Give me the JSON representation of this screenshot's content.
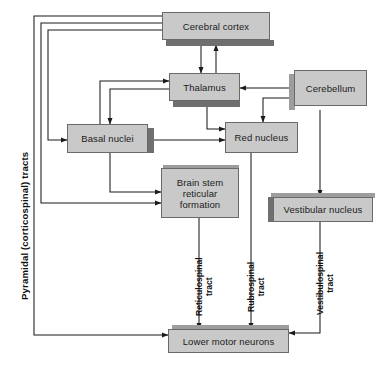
{
  "diagram": {
    "side_label": "Pyramidal (corticospinal) tracts",
    "colors": {
      "box_fill": "#c9c9c9",
      "box_border": "#6a6a6a",
      "shadow_dark": "#6f6f6f",
      "shadow_light": "#9d9d9d",
      "line": "#1b1b1b",
      "background": "#ffffff",
      "text": "#1b1b1b"
    },
    "nodes": [
      {
        "id": "cerebral_cortex",
        "label": "Cerebral cortex"
      },
      {
        "id": "thalamus",
        "label": "Thalamus"
      },
      {
        "id": "cerebellum",
        "label": "Cerebellum"
      },
      {
        "id": "basal_nuclei",
        "label": "Basal nuclei"
      },
      {
        "id": "red_nucleus",
        "label": "Red nucleus"
      },
      {
        "id": "brain_stem",
        "label": "Brain stem reticular formation",
        "lines": [
          "Brain stem",
          "reticular",
          "formation"
        ]
      },
      {
        "id": "vestibular_nucleus",
        "label": "Vestibular nucleus"
      },
      {
        "id": "lower_motor",
        "label": "Lower motor neurons"
      }
    ],
    "tracts": [
      {
        "id": "reticulospinal",
        "line1": "Reticulospinal",
        "line2": "tract"
      },
      {
        "id": "rubrospinal",
        "line1": "Rubrospinal",
        "line2": "tract"
      },
      {
        "id": "vestibulospinal",
        "line1": "Vestibulospinal",
        "line2": "tract"
      }
    ],
    "connections": [
      {
        "from": "cerebral_cortex",
        "to": "thalamus"
      },
      {
        "from": "thalamus",
        "to": "cerebral_cortex"
      },
      {
        "from": "cerebral_cortex",
        "to": "basal_nuclei"
      },
      {
        "from": "cerebral_cortex",
        "to": "brain_stem"
      },
      {
        "from": "cerebral_cortex",
        "to": "lower_motor"
      },
      {
        "from": "basal_nuclei",
        "to": "thalamus"
      },
      {
        "from": "thalamus",
        "to": "red_nucleus"
      },
      {
        "from": "basal_nuclei",
        "to": "red_nucleus"
      },
      {
        "from": "basal_nuclei",
        "to": "brain_stem"
      },
      {
        "from": "cerebellum",
        "to": "thalamus"
      },
      {
        "from": "cerebellum",
        "to": "red_nucleus"
      },
      {
        "from": "cerebellum",
        "to": "vestibular_nucleus"
      },
      {
        "from": "brain_stem",
        "to": "lower_motor",
        "via": "reticulospinal"
      },
      {
        "from": "red_nucleus",
        "to": "lower_motor",
        "via": "rubrospinal"
      },
      {
        "from": "vestibular_nucleus",
        "to": "lower_motor",
        "via": "vestibulospinal"
      }
    ]
  }
}
